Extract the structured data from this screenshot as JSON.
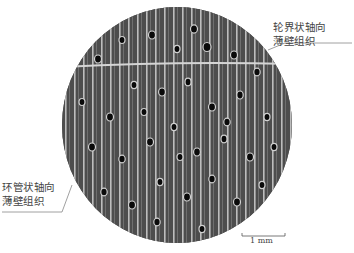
{
  "figure": {
    "type": "wood cross-section micrograph",
    "labels": {
      "top_right": {
        "line1": "轮界状轴向",
        "line2": "薄壁组织"
      },
      "bottom_left": {
        "line1": "环管状轴向",
        "line2": "薄壁组织"
      }
    },
    "scale_bar": {
      "label": "1 mm"
    },
    "colors": {
      "background": "#ffffff",
      "tissue": "#4a4a4a",
      "rays": "#cfcfcf",
      "vessels": "#0a0a0a",
      "leader_line": "#888888",
      "text": "#444444"
    }
  }
}
